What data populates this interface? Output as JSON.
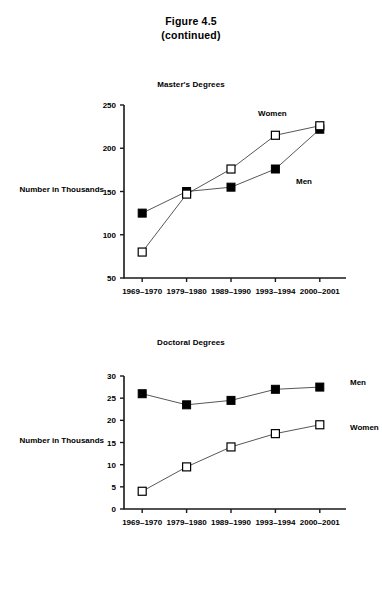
{
  "figure": {
    "title_line1": "Figure 4.5",
    "title_line2": "(continued)"
  },
  "charts": [
    {
      "panel_title": "Master's Degrees",
      "ylabel": "Number in Thousands"
    },
    {
      "panel_title": "Doctoral Degrees",
      "ylabel": "Number in Thousands"
    }
  ],
  "chart_data": [
    {
      "type": "line",
      "title": "Master's Degrees",
      "xlabel": "",
      "ylabel": "Number in Thousands",
      "categories": [
        "1969–1970",
        "1979–1980",
        "1989–1990",
        "1993–1994",
        "2000–2001"
      ],
      "ylim": [
        50,
        250
      ],
      "yticks": [
        50,
        100,
        150,
        200,
        250
      ],
      "grid": false,
      "legend_position": "inline-annotations",
      "series": [
        {
          "name": "Men",
          "marker": "filled-square",
          "values": [
            125,
            150,
            155,
            176,
            222
          ],
          "annotation": "Men"
        },
        {
          "name": "Women",
          "marker": "open-square",
          "values": [
            80,
            147,
            176,
            215,
            226
          ],
          "annotation": "Women"
        }
      ]
    },
    {
      "type": "line",
      "title": "Doctoral Degrees",
      "xlabel": "",
      "ylabel": "Number in Thousands",
      "categories": [
        "1969–1970",
        "1979–1980",
        "1989–1990",
        "1993–1994",
        "2000–2001"
      ],
      "ylim": [
        0,
        30
      ],
      "yticks": [
        0,
        5,
        10,
        15,
        20,
        25,
        30
      ],
      "grid": false,
      "legend_position": "inline-annotations",
      "series": [
        {
          "name": "Men",
          "marker": "filled-square",
          "values": [
            26,
            23.5,
            24.5,
            27,
            27.5
          ],
          "annotation": "Men"
        },
        {
          "name": "Women",
          "marker": "open-square",
          "values": [
            4,
            9.5,
            14,
            17,
            19
          ],
          "annotation": "Women"
        }
      ]
    }
  ]
}
